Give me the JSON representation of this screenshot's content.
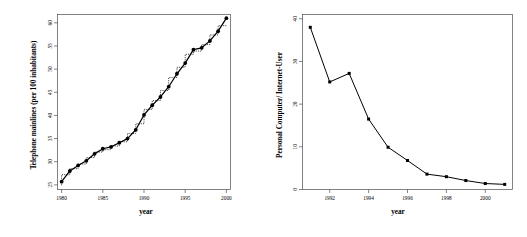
{
  "figure": {
    "panels": [
      "left",
      "right"
    ],
    "background_color": "#ffffff",
    "line_color": "#000000",
    "axis_color": "#4d4d4d"
  },
  "left_panel": {
    "xlabel": "year",
    "ylabel": "Telephone mainlines (per 100 inhabitants)",
    "x_ticks": [
      "1980",
      "1985",
      "1990",
      "1995",
      "2000"
    ],
    "y_ticks": [
      "25",
      "30",
      "35",
      "40",
      "45",
      "50",
      "55",
      "60"
    ]
  },
  "right_panel": {
    "xlabel": "year",
    "ylabel": "Personal Computer/ Internet-User",
    "x_ticks": [
      "1992",
      "1994",
      "1996",
      "1998",
      "2000"
    ],
    "y_ticks": [
      "0",
      "10",
      "20",
      "30",
      "40"
    ]
  },
  "chart_data": [
    {
      "type": "line",
      "panel": "left",
      "title": "",
      "xlabel": "year",
      "ylabel": "Telephone mainlines (per 100 inhabitants)",
      "xlim": [
        1979.5,
        2000.5
      ],
      "ylim": [
        24.0,
        61.8
      ],
      "xtick_values": [
        1980,
        1985,
        1990,
        1995,
        2000
      ],
      "xtick_labels": [
        "1980",
        "1985",
        "1990",
        "1995",
        "2000"
      ],
      "ytick_values": [
        25,
        30,
        35,
        40,
        45,
        50,
        55,
        60
      ],
      "ytick_labels": [
        "25",
        "30",
        "35",
        "40",
        "45",
        "50",
        "55",
        "60"
      ],
      "grid": false,
      "legend": false,
      "series": [
        {
          "name": "Telephone mainlines",
          "style": "solid-with-points",
          "marker": "filled-circle",
          "x": [
            1980,
            1981,
            1982,
            1983,
            1984,
            1985,
            1986,
            1987,
            1988,
            1989,
            1990,
            1991,
            1992,
            1993,
            1994,
            1995,
            1996,
            1997,
            1998,
            1999,
            2000
          ],
          "values": [
            25.7,
            28.0,
            29.2,
            30.2,
            31.7,
            32.8,
            33.2,
            34.1,
            35.0,
            36.9,
            40.1,
            42.2,
            44.0,
            46.2,
            49.0,
            51.3,
            54.2,
            54.6,
            56.1,
            58.2,
            61.0
          ]
        },
        {
          "name": "Fitted step comparison",
          "style": "dotted-step",
          "marker": "none",
          "x": [
            1980,
            1981,
            1982,
            1983,
            1984,
            1985,
            1986,
            1987,
            1988,
            1989,
            1990,
            1991,
            1992,
            1993,
            1994,
            1995,
            1996,
            1997,
            1998,
            1999,
            2000
          ],
          "values": [
            24.9,
            27.2,
            28.5,
            29.5,
            30.9,
            32.1,
            32.6,
            33.4,
            34.3,
            36.1,
            38.2,
            41.3,
            43.2,
            45.4,
            48.2,
            50.4,
            53.2,
            53.9,
            55.3,
            57.4,
            59.4
          ]
        }
      ]
    },
    {
      "type": "line",
      "panel": "right",
      "title": "",
      "xlabel": "year",
      "ylabel": "Personal Computer/ Internet-User",
      "xlim": [
        1990.6,
        2001.4
      ],
      "ylim": [
        0.0,
        41.0
      ],
      "xtick_values": [
        1992,
        1994,
        1996,
        1998,
        2000
      ],
      "xtick_labels": [
        "1992",
        "1994",
        "1996",
        "1998",
        "2000"
      ],
      "ytick_values": [
        0,
        10,
        20,
        30,
        40
      ],
      "ytick_labels": [
        "0",
        "10",
        "20",
        "30",
        "40"
      ],
      "grid": false,
      "legend": false,
      "series": [
        {
          "name": "Personal Computer/ Internet-User ratio",
          "style": "solid-with-points",
          "marker": "filled-square",
          "x": [
            1991,
            1992,
            1993,
            1994,
            1995,
            1996,
            1997,
            1998,
            1999,
            2000,
            2001
          ],
          "values": [
            38.0,
            25.2,
            27.2,
            16.5,
            9.9,
            6.8,
            3.6,
            3.0,
            2.1,
            1.4,
            1.2
          ]
        }
      ]
    }
  ]
}
